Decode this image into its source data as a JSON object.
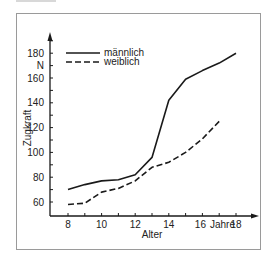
{
  "chart_data": {
    "type": "line",
    "title": "",
    "xlabel": "Alter",
    "ylabel": "Zugkraft",
    "x_unit": "Jahre",
    "y_unit": "N",
    "x": [
      8,
      9,
      10,
      11,
      12,
      13,
      14,
      15,
      16,
      17,
      18
    ],
    "xticks": [
      8,
      10,
      12,
      14,
      16,
      18
    ],
    "yticks": [
      60,
      80,
      100,
      120,
      140,
      160,
      180
    ],
    "xlim": [
      7,
      19.3
    ],
    "ylim": [
      56,
      200
    ],
    "grid": false,
    "legend_position": "upper left",
    "series": [
      {
        "name": "männlich",
        "style": "solid",
        "x": [
          8,
          9,
          10,
          11,
          12,
          13,
          14,
          15,
          16,
          17,
          18
        ],
        "values": [
          70,
          74,
          77,
          78,
          82,
          96,
          142,
          159,
          166,
          172,
          180
        ]
      },
      {
        "name": "weiblich",
        "style": "dashed",
        "x": [
          8,
          9,
          10,
          11,
          12,
          13,
          14,
          15,
          16,
          17
        ],
        "values": [
          58,
          59,
          68,
          71,
          77,
          88,
          92,
          100,
          111,
          125
        ]
      }
    ]
  },
  "labels": {
    "ylabel": "Zugkraft",
    "y_unit": "N",
    "xlabel": "Alter",
    "x_unit": "Jahre",
    "legend_male": "männlich",
    "legend_female": "weiblich"
  },
  "colors": {
    "line": "#1a1a1a",
    "frame": "#9a9a9a"
  }
}
